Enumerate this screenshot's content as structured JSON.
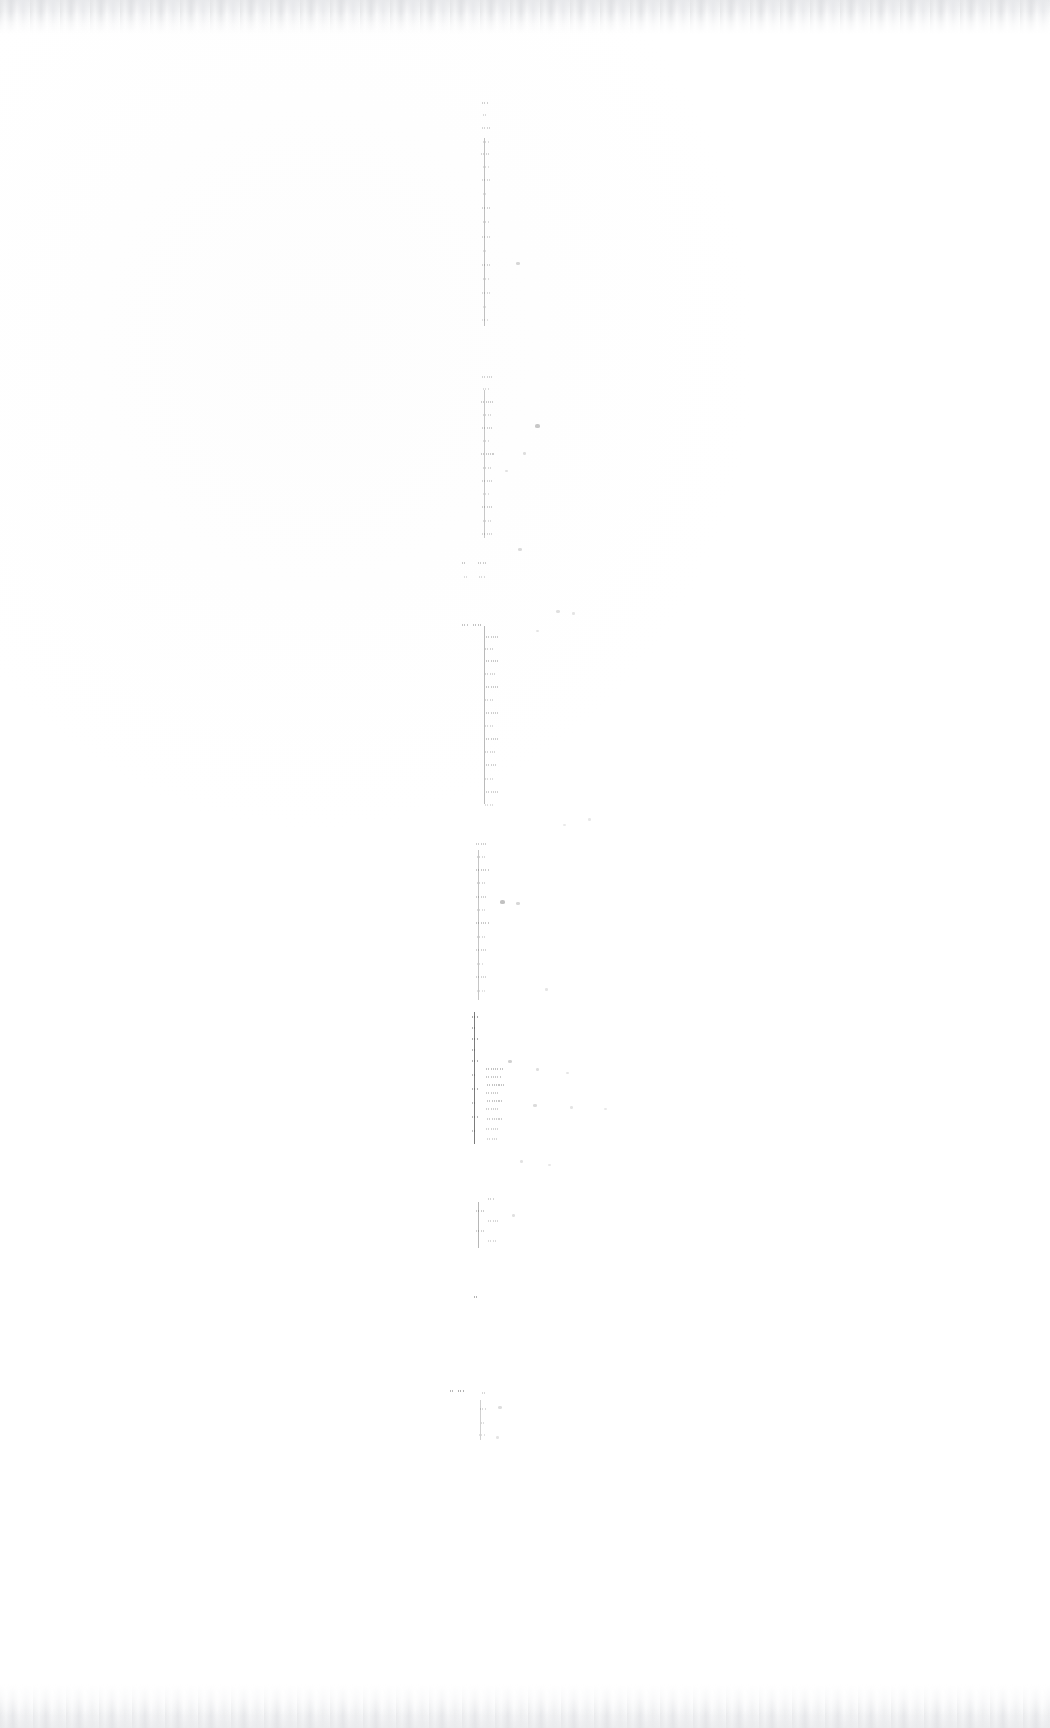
{
  "document": {
    "kind": "scanned-page",
    "condition": "severely-faded",
    "legible_text": "",
    "page_width": 1050,
    "page_height": 1728,
    "paper_color": "#fefefe",
    "ink_color": "#4a4a4a",
    "edge_artifact_color": "#e4e5e7",
    "notes_visible_on_page": "none"
  },
  "ink_region": {
    "x_min": 462,
    "x_max": 530,
    "y_min": 100,
    "y_max": 1442,
    "stray_x_max": 605
  },
  "blocks": [
    {
      "name": "block-1",
      "x": 470,
      "y": 100,
      "width": 46,
      "height": 232,
      "rule_x": 14,
      "rule_opacity": 0.34,
      "rule_top": 38,
      "rule_bottom": 6,
      "density": 0.3,
      "lines": [
        {
          "top": 2,
          "left": 12,
          "width": 7,
          "opacity": 0.26
        },
        {
          "top": 14,
          "left": 13,
          "width": 5,
          "opacity": 0.2
        },
        {
          "top": 27,
          "left": 12,
          "width": 8,
          "opacity": 0.23
        },
        {
          "top": 41,
          "left": 13,
          "width": 6,
          "opacity": 0.18
        },
        {
          "top": 53,
          "left": 11,
          "width": 9,
          "opacity": 0.22
        },
        {
          "top": 66,
          "left": 13,
          "width": 6,
          "opacity": 0.17
        },
        {
          "top": 79,
          "left": 12,
          "width": 8,
          "opacity": 0.21
        },
        {
          "top": 93,
          "left": 13,
          "width": 5,
          "opacity": 0.16
        },
        {
          "top": 107,
          "left": 12,
          "width": 9,
          "opacity": 0.24
        },
        {
          "top": 121,
          "left": 13,
          "width": 6,
          "opacity": 0.19
        },
        {
          "top": 136,
          "left": 12,
          "width": 8,
          "opacity": 0.22
        },
        {
          "top": 150,
          "left": 13,
          "width": 5,
          "opacity": 0.15
        },
        {
          "top": 164,
          "left": 12,
          "width": 9,
          "opacity": 0.23
        },
        {
          "top": 178,
          "left": 13,
          "width": 6,
          "opacity": 0.18
        },
        {
          "top": 192,
          "left": 12,
          "width": 8,
          "opacity": 0.2
        },
        {
          "top": 206,
          "left": 13,
          "width": 5,
          "opacity": 0.14
        },
        {
          "top": 219,
          "left": 12,
          "width": 7,
          "opacity": 0.17
        }
      ]
    },
    {
      "name": "block-2",
      "x": 464,
      "y": 372,
      "width": 64,
      "height": 176,
      "rule_x": 20,
      "rule_opacity": 0.3,
      "rule_top": 18,
      "rule_bottom": 10,
      "density": 0.34,
      "lines": [
        {
          "top": 4,
          "left": 18,
          "width": 10,
          "opacity": 0.24
        },
        {
          "top": 16,
          "left": 19,
          "width": 7,
          "opacity": 0.19
        },
        {
          "top": 29,
          "left": 17,
          "width": 12,
          "opacity": 0.27
        },
        {
          "top": 42,
          "left": 19,
          "width": 8,
          "opacity": 0.2
        },
        {
          "top": 55,
          "left": 18,
          "width": 11,
          "opacity": 0.25
        },
        {
          "top": 68,
          "left": 19,
          "width": 7,
          "opacity": 0.18
        },
        {
          "top": 81,
          "left": 17,
          "width": 13,
          "opacity": 0.28
        },
        {
          "top": 95,
          "left": 19,
          "width": 8,
          "opacity": 0.21
        },
        {
          "top": 108,
          "left": 18,
          "width": 11,
          "opacity": 0.24
        },
        {
          "top": 121,
          "left": 19,
          "width": 7,
          "opacity": 0.17
        },
        {
          "top": 134,
          "left": 18,
          "width": 12,
          "opacity": 0.26
        },
        {
          "top": 148,
          "left": 19,
          "width": 8,
          "opacity": 0.19
        },
        {
          "top": 161,
          "left": 18,
          "width": 10,
          "opacity": 0.22
        }
      ]
    },
    {
      "name": "block-3",
      "x": 462,
      "y": 556,
      "width": 72,
      "height": 34,
      "rule_x": 0,
      "rule_opacity": 0,
      "rule_top": 0,
      "rule_bottom": 0,
      "density": 0.22,
      "lines": [
        {
          "top": 6,
          "left": 0,
          "width": 5,
          "opacity": 0.3
        },
        {
          "top": 6,
          "left": 16,
          "width": 8,
          "opacity": 0.28
        },
        {
          "top": 20,
          "left": 2,
          "width": 4,
          "opacity": 0.18
        },
        {
          "top": 20,
          "left": 17,
          "width": 6,
          "opacity": 0.2
        }
      ]
    },
    {
      "name": "block-4",
      "x": 462,
      "y": 622,
      "width": 76,
      "height": 196,
      "rule_x": 22,
      "rule_opacity": 0.38,
      "rule_top": 4,
      "rule_bottom": 14,
      "density": 0.38,
      "lines": [
        {
          "top": 2,
          "left": 0,
          "width": 6,
          "opacity": 0.32
        },
        {
          "top": 2,
          "left": 11,
          "width": 9,
          "opacity": 0.34
        },
        {
          "top": 14,
          "left": 24,
          "width": 12,
          "opacity": 0.28
        },
        {
          "top": 26,
          "left": 23,
          "width": 9,
          "opacity": 0.24
        },
        {
          "top": 38,
          "left": 24,
          "width": 14,
          "opacity": 0.3
        },
        {
          "top": 51,
          "left": 23,
          "width": 10,
          "opacity": 0.23
        },
        {
          "top": 64,
          "left": 24,
          "width": 13,
          "opacity": 0.29
        },
        {
          "top": 77,
          "left": 23,
          "width": 9,
          "opacity": 0.21
        },
        {
          "top": 90,
          "left": 24,
          "width": 12,
          "opacity": 0.27
        },
        {
          "top": 103,
          "left": 23,
          "width": 8,
          "opacity": 0.2
        },
        {
          "top": 116,
          "left": 24,
          "width": 14,
          "opacity": 0.28
        },
        {
          "top": 129,
          "left": 23,
          "width": 10,
          "opacity": 0.22
        },
        {
          "top": 142,
          "left": 24,
          "width": 11,
          "opacity": 0.26
        },
        {
          "top": 156,
          "left": 23,
          "width": 8,
          "opacity": 0.19
        },
        {
          "top": 169,
          "left": 24,
          "width": 12,
          "opacity": 0.25
        },
        {
          "top": 182,
          "left": 23,
          "width": 9,
          "opacity": 0.18
        }
      ]
    },
    {
      "name": "block-5",
      "x": 462,
      "y": 840,
      "width": 78,
      "height": 168,
      "rule_x": 16,
      "rule_opacity": 0.32,
      "rule_top": 10,
      "rule_bottom": 8,
      "density": 0.3,
      "lines": [
        {
          "top": 3,
          "left": 14,
          "width": 11,
          "opacity": 0.27
        },
        {
          "top": 16,
          "left": 15,
          "width": 8,
          "opacity": 0.21
        },
        {
          "top": 29,
          "left": 14,
          "width": 13,
          "opacity": 0.29
        },
        {
          "top": 42,
          "left": 15,
          "width": 9,
          "opacity": 0.22
        },
        {
          "top": 56,
          "left": 14,
          "width": 12,
          "opacity": 0.26
        },
        {
          "top": 69,
          "left": 15,
          "width": 8,
          "opacity": 0.19
        },
        {
          "top": 82,
          "left": 14,
          "width": 14,
          "opacity": 0.3
        },
        {
          "top": 96,
          "left": 15,
          "width": 9,
          "opacity": 0.2
        },
        {
          "top": 109,
          "left": 14,
          "width": 11,
          "opacity": 0.24
        },
        {
          "top": 123,
          "left": 15,
          "width": 7,
          "opacity": 0.17
        },
        {
          "top": 136,
          "left": 14,
          "width": 10,
          "opacity": 0.23
        },
        {
          "top": 150,
          "left": 15,
          "width": 8,
          "opacity": 0.16
        }
      ]
    },
    {
      "name": "block-6",
      "x": 466,
      "y": 1012,
      "width": 76,
      "height": 132,
      "rule_x": 8,
      "rule_opacity": 0.72,
      "rule_top": 0,
      "rule_bottom": 0,
      "density": 0.52,
      "lines": [
        {
          "top": 4,
          "left": 6,
          "width": 6,
          "opacity": 0.48
        },
        {
          "top": 15,
          "left": 6,
          "width": 5,
          "opacity": 0.42
        },
        {
          "top": 26,
          "left": 6,
          "width": 7,
          "opacity": 0.46
        },
        {
          "top": 37,
          "left": 6,
          "width": 5,
          "opacity": 0.4
        },
        {
          "top": 48,
          "left": 6,
          "width": 6,
          "opacity": 0.44
        },
        {
          "top": 56,
          "left": 20,
          "width": 18,
          "opacity": 0.34
        },
        {
          "top": 64,
          "left": 20,
          "width": 15,
          "opacity": 0.3
        },
        {
          "top": 62,
          "left": 6,
          "width": 5,
          "opacity": 0.38
        },
        {
          "top": 72,
          "left": 21,
          "width": 17,
          "opacity": 0.33
        },
        {
          "top": 76,
          "left": 6,
          "width": 6,
          "opacity": 0.42
        },
        {
          "top": 80,
          "left": 20,
          "width": 14,
          "opacity": 0.28
        },
        {
          "top": 88,
          "left": 21,
          "width": 16,
          "opacity": 0.31
        },
        {
          "top": 90,
          "left": 6,
          "width": 5,
          "opacity": 0.36
        },
        {
          "top": 96,
          "left": 20,
          "width": 13,
          "opacity": 0.26
        },
        {
          "top": 104,
          "left": 6,
          "width": 6,
          "opacity": 0.4
        },
        {
          "top": 106,
          "left": 21,
          "width": 15,
          "opacity": 0.27
        },
        {
          "top": 116,
          "left": 20,
          "width": 12,
          "opacity": 0.24
        },
        {
          "top": 118,
          "left": 6,
          "width": 5,
          "opacity": 0.34
        },
        {
          "top": 126,
          "left": 21,
          "width": 10,
          "opacity": 0.22
        }
      ]
    },
    {
      "name": "block-7",
      "x": 464,
      "y": 1196,
      "width": 70,
      "height": 56,
      "rule_x": 14,
      "rule_opacity": 0.4,
      "rule_top": 6,
      "rule_bottom": 4,
      "density": 0.26,
      "lines": [
        {
          "top": 2,
          "left": 24,
          "width": 7,
          "opacity": 0.24
        },
        {
          "top": 14,
          "left": 12,
          "width": 9,
          "opacity": 0.28
        },
        {
          "top": 24,
          "left": 24,
          "width": 10,
          "opacity": 0.22
        },
        {
          "top": 34,
          "left": 12,
          "width": 8,
          "opacity": 0.25
        },
        {
          "top": 44,
          "left": 24,
          "width": 9,
          "opacity": 0.2
        }
      ]
    },
    {
      "name": "block-8",
      "x": 470,
      "y": 1292,
      "width": 40,
      "height": 18,
      "rule_x": 0,
      "rule_opacity": 0,
      "rule_top": 0,
      "rule_bottom": 0,
      "density": 0.2,
      "lines": [
        {
          "top": 4,
          "left": 4,
          "width": 4,
          "opacity": 0.42
        }
      ]
    },
    {
      "name": "block-9",
      "x": 450,
      "y": 1384,
      "width": 86,
      "height": 58,
      "rule_x": 30,
      "rule_opacity": 0.26,
      "rule_top": 16,
      "rule_bottom": 2,
      "density": 0.24,
      "lines": [
        {
          "top": 6,
          "left": 0,
          "width": 5,
          "opacity": 0.4
        },
        {
          "top": 6,
          "left": 8,
          "width": 7,
          "opacity": 0.44
        },
        {
          "top": 8,
          "left": 32,
          "width": 4,
          "opacity": 0.22
        },
        {
          "top": 24,
          "left": 30,
          "width": 6,
          "opacity": 0.2
        },
        {
          "top": 38,
          "left": 31,
          "width": 5,
          "opacity": 0.18
        },
        {
          "top": 50,
          "left": 29,
          "width": 7,
          "opacity": 0.16
        }
      ]
    }
  ],
  "stray_marks": [
    {
      "x": 516,
      "y": 262,
      "w": 4,
      "h": 3,
      "opacity": 0.22
    },
    {
      "x": 535,
      "y": 424,
      "w": 5,
      "h": 4,
      "opacity": 0.3
    },
    {
      "x": 523,
      "y": 452,
      "w": 3,
      "h": 3,
      "opacity": 0.18
    },
    {
      "x": 505,
      "y": 470,
      "w": 3,
      "h": 2,
      "opacity": 0.16
    },
    {
      "x": 518,
      "y": 548,
      "w": 4,
      "h": 3,
      "opacity": 0.2
    },
    {
      "x": 556,
      "y": 610,
      "w": 4,
      "h": 3,
      "opacity": 0.17
    },
    {
      "x": 572,
      "y": 612,
      "w": 3,
      "h": 3,
      "opacity": 0.14
    },
    {
      "x": 536,
      "y": 630,
      "w": 3,
      "h": 2,
      "opacity": 0.15
    },
    {
      "x": 588,
      "y": 818,
      "w": 3,
      "h": 3,
      "opacity": 0.13
    },
    {
      "x": 563,
      "y": 824,
      "w": 3,
      "h": 2,
      "opacity": 0.12
    },
    {
      "x": 500,
      "y": 900,
      "w": 5,
      "h": 4,
      "opacity": 0.34
    },
    {
      "x": 516,
      "y": 902,
      "w": 4,
      "h": 3,
      "opacity": 0.22
    },
    {
      "x": 545,
      "y": 988,
      "w": 3,
      "h": 3,
      "opacity": 0.14
    },
    {
      "x": 508,
      "y": 1060,
      "w": 4,
      "h": 3,
      "opacity": 0.26
    },
    {
      "x": 536,
      "y": 1068,
      "w": 3,
      "h": 3,
      "opacity": 0.18
    },
    {
      "x": 566,
      "y": 1072,
      "w": 3,
      "h": 2,
      "opacity": 0.14
    },
    {
      "x": 533,
      "y": 1104,
      "w": 4,
      "h": 3,
      "opacity": 0.2
    },
    {
      "x": 570,
      "y": 1106,
      "w": 3,
      "h": 3,
      "opacity": 0.15
    },
    {
      "x": 604,
      "y": 1108,
      "w": 3,
      "h": 2,
      "opacity": 0.12
    },
    {
      "x": 520,
      "y": 1160,
      "w": 3,
      "h": 3,
      "opacity": 0.16
    },
    {
      "x": 548,
      "y": 1164,
      "w": 3,
      "h": 2,
      "opacity": 0.13
    },
    {
      "x": 512,
      "y": 1214,
      "w": 3,
      "h": 3,
      "opacity": 0.17
    },
    {
      "x": 498,
      "y": 1406,
      "w": 4,
      "h": 3,
      "opacity": 0.19
    },
    {
      "x": 496,
      "y": 1436,
      "w": 3,
      "h": 3,
      "opacity": 0.15
    }
  ]
}
